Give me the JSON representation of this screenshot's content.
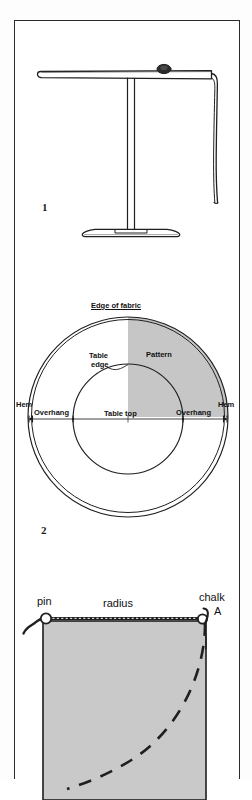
{
  "plate": {
    "figure_1": {
      "number": "1",
      "caption_items": [
        "round table",
        "cloth draped over edge"
      ]
    },
    "figure_2": {
      "number": "2",
      "labels": {
        "edge_of_fabric": "Edge of fabric",
        "pattern": "Pattern",
        "table_edge_line1": "Table",
        "table_edge_line2": "edge",
        "hem_left": "Hem",
        "hem_right": "Hem",
        "overhang_left": "Overhang",
        "overhang_right": "Overhang",
        "table_top": "Table top"
      }
    },
    "figure_3": {
      "labels": {
        "pin": "pin",
        "radius": "radius",
        "chalk": "chalk",
        "point_a": "A"
      }
    }
  },
  "colors": {
    "ink": "#1f1f1f",
    "fabric_shade": "#c9c9c9",
    "pattern_shade": "#c6c6c6",
    "paper": "#ffffff"
  }
}
